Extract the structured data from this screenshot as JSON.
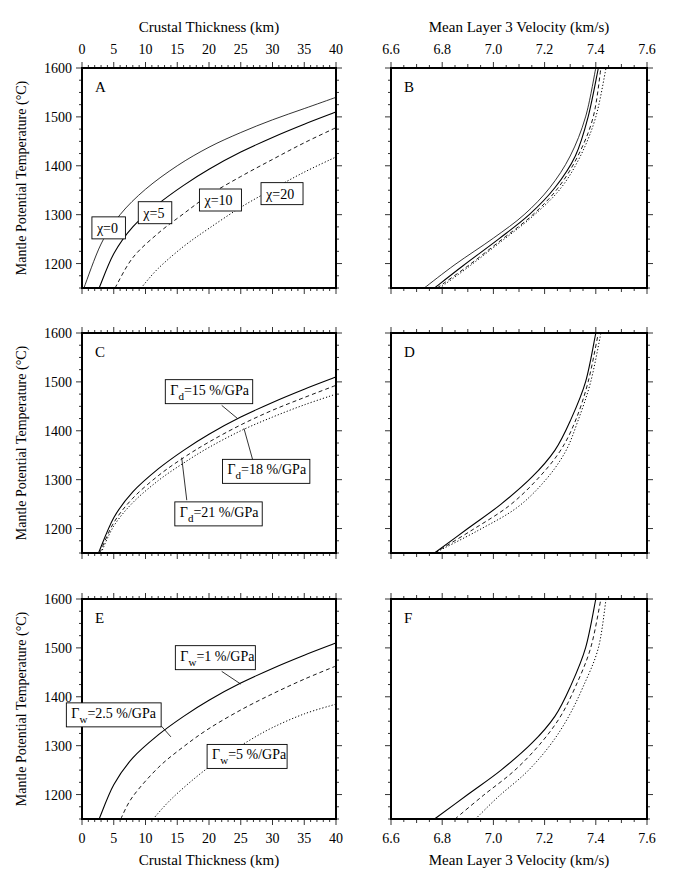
{
  "figure": {
    "top_left_xlabel": "Crustal Thickness (km)",
    "top_right_xlabel": "Mean Layer 3 Velocity (km/s)",
    "bottom_left_xlabel": "Crustal Thickness (km)",
    "bottom_right_xlabel": "Mean Layer 3 Velocity (km/s)",
    "ylabel": "Mantle Potential Temperature (°C)"
  },
  "chart_data": [
    {
      "panel": "A",
      "type": "line",
      "xlabel": "Crustal Thickness (km)",
      "ylabel": "Mantle Potential Temperature (°C)",
      "xlim": [
        0,
        40
      ],
      "ylim": [
        1150,
        1600
      ],
      "xticks": [
        0,
        5,
        10,
        15,
        20,
        25,
        30,
        35,
        40
      ],
      "yticks": [
        1200,
        1300,
        1400,
        1500,
        1600
      ],
      "grid": false,
      "series": [
        {
          "name": "χ=0",
          "style": "solid-thin",
          "x": [
            0.3,
            3,
            6,
            10,
            15,
            20,
            25,
            30,
            35,
            40
          ],
          "y": [
            1150,
            1240,
            1300,
            1352,
            1400,
            1438,
            1468,
            1494,
            1517,
            1540
          ]
        },
        {
          "name": "χ=5",
          "style": "solid",
          "x": [
            2.7,
            5,
            8,
            12,
            16,
            20,
            25,
            30,
            35,
            40
          ],
          "y": [
            1150,
            1220,
            1275,
            1322,
            1360,
            1393,
            1428,
            1458,
            1485,
            1510
          ]
        },
        {
          "name": "χ=10",
          "style": "dashed",
          "x": [
            5.2,
            8,
            12,
            16,
            20,
            25,
            30,
            35,
            40
          ],
          "y": [
            1150,
            1212,
            1262,
            1302,
            1340,
            1378,
            1413,
            1447,
            1478
          ]
        },
        {
          "name": "χ=20",
          "style": "dotted",
          "x": [
            9.3,
            12,
            16,
            20,
            25,
            30,
            35,
            40
          ],
          "y": [
            1150,
            1190,
            1235,
            1272,
            1315,
            1352,
            1387,
            1418
          ]
        }
      ],
      "annotations": [
        {
          "text": "χ=0",
          "x": 4.2,
          "y": 1273
        },
        {
          "text": "χ=5",
          "x": 11.5,
          "y": 1304
        },
        {
          "text": "χ=10",
          "x": 21.8,
          "y": 1330
        },
        {
          "text": "χ=20",
          "x": 31.5,
          "y": 1343
        }
      ]
    },
    {
      "panel": "B",
      "type": "line",
      "xlabel": "Mean Layer 3 Velocity (km/s)",
      "ylabel": "",
      "xlim": [
        6.6,
        7.6
      ],
      "ylim": [
        1150,
        1600
      ],
      "xticks": [
        6.6,
        6.8,
        7.0,
        7.2,
        7.4,
        7.6
      ],
      "yticks": [
        1200,
        1300,
        1400,
        1500,
        1600
      ],
      "grid": false,
      "series": [
        {
          "name": "χ=0",
          "style": "solid-thin",
          "x": [
            6.73,
            6.85,
            7.0,
            7.12,
            7.22,
            7.3,
            7.36,
            7.4
          ],
          "y": [
            1150,
            1198,
            1252,
            1300,
            1355,
            1420,
            1500,
            1600
          ]
        },
        {
          "name": "χ=5",
          "style": "solid",
          "x": [
            6.77,
            6.88,
            7.02,
            7.14,
            7.24,
            7.32,
            7.37,
            7.41
          ],
          "y": [
            1150,
            1195,
            1250,
            1300,
            1355,
            1420,
            1500,
            1600
          ]
        },
        {
          "name": "χ=10",
          "style": "dashed",
          "x": [
            6.78,
            6.9,
            7.03,
            7.15,
            7.25,
            7.33,
            7.39,
            7.42
          ],
          "y": [
            1150,
            1195,
            1248,
            1298,
            1353,
            1420,
            1500,
            1600
          ]
        },
        {
          "name": "χ=20",
          "style": "dotted",
          "x": [
            6.79,
            6.9,
            7.03,
            7.15,
            7.26,
            7.34,
            7.4,
            7.44
          ],
          "y": [
            1150,
            1192,
            1245,
            1295,
            1352,
            1420,
            1500,
            1600
          ]
        }
      ]
    },
    {
      "panel": "C",
      "type": "line",
      "xlabel": "Crustal Thickness (km)",
      "ylabel": "Mantle Potential Temperature (°C)",
      "xlim": [
        0,
        40
      ],
      "ylim": [
        1150,
        1600
      ],
      "xticks": [
        0,
        5,
        10,
        15,
        20,
        25,
        30,
        35,
        40
      ],
      "yticks": [
        1200,
        1300,
        1400,
        1500,
        1600
      ],
      "grid": false,
      "series": [
        {
          "name": "Γd=15 %/GPa",
          "style": "solid",
          "x": [
            2.6,
            5,
            8,
            12,
            16,
            20,
            25,
            30,
            35,
            40
          ],
          "y": [
            1150,
            1222,
            1275,
            1322,
            1360,
            1393,
            1428,
            1458,
            1485,
            1510
          ]
        },
        {
          "name": "Γd=18 %/GPa",
          "style": "dashed",
          "x": [
            2.8,
            5,
            8,
            12,
            16,
            20,
            25,
            30,
            35,
            40
          ],
          "y": [
            1150,
            1212,
            1262,
            1308,
            1345,
            1377,
            1412,
            1442,
            1468,
            1493
          ]
        },
        {
          "name": "Γd=21 %/GPa",
          "style": "dotted",
          "x": [
            3.0,
            5,
            8,
            12,
            16,
            20,
            25,
            30,
            35,
            40
          ],
          "y": [
            1150,
            1205,
            1253,
            1298,
            1334,
            1366,
            1400,
            1428,
            1453,
            1475
          ]
        }
      ],
      "annotations": [
        {
          "text": "Γd=15 %/GPa",
          "x": 20,
          "y": 1480
        },
        {
          "text": "Γd=18 %/GPa",
          "x": 29,
          "y": 1317
        },
        {
          "text": "Γd=21 %/GPa",
          "x": 21.5,
          "y": 1230
        }
      ]
    },
    {
      "panel": "D",
      "type": "line",
      "xlabel": "Mean Layer 3 Velocity (km/s)",
      "ylabel": "",
      "xlim": [
        6.6,
        7.6
      ],
      "ylim": [
        1150,
        1600
      ],
      "xticks": [
        6.6,
        6.8,
        7.0,
        7.2,
        7.4,
        7.6
      ],
      "yticks": [
        1200,
        1300,
        1400,
        1500,
        1600
      ],
      "grid": false,
      "series": [
        {
          "name": "Γd=15 %/GPa",
          "style": "solid",
          "x": [
            6.77,
            6.9,
            7.03,
            7.15,
            7.24,
            7.3,
            7.36,
            7.4
          ],
          "y": [
            1150,
            1200,
            1250,
            1305,
            1360,
            1420,
            1500,
            1600
          ]
        },
        {
          "name": "Γd=18 %/GPa",
          "style": "dashed",
          "x": [
            6.77,
            6.92,
            7.06,
            7.17,
            7.26,
            7.32,
            7.37,
            7.41
          ],
          "y": [
            1150,
            1198,
            1246,
            1300,
            1358,
            1420,
            1500,
            1600
          ]
        },
        {
          "name": "Γd=21 %/GPa",
          "style": "dotted",
          "x": [
            6.77,
            6.94,
            7.09,
            7.2,
            7.28,
            7.33,
            7.38,
            7.42
          ],
          "y": [
            1150,
            1196,
            1242,
            1297,
            1356,
            1420,
            1500,
            1600
          ]
        }
      ]
    },
    {
      "panel": "E",
      "type": "line",
      "xlabel": "Crustal Thickness (km)",
      "ylabel": "Mantle Potential Temperature (°C)",
      "xlim": [
        0,
        40
      ],
      "ylim": [
        1150,
        1600
      ],
      "xticks": [
        0,
        5,
        10,
        15,
        20,
        25,
        30,
        35,
        40
      ],
      "yticks": [
        1200,
        1300,
        1400,
        1500,
        1600
      ],
      "grid": false,
      "series": [
        {
          "name": "Γw=1 %/GPa",
          "style": "solid",
          "x": [
            2.7,
            5,
            8,
            12,
            16,
            20,
            25,
            30,
            35,
            40
          ],
          "y": [
            1150,
            1220,
            1275,
            1322,
            1360,
            1393,
            1428,
            1458,
            1485,
            1510
          ]
        },
        {
          "name": "Γw=2.5 %/GPa",
          "style": "dashed",
          "x": [
            6.1,
            8,
            12,
            16,
            20,
            25,
            30,
            35,
            40
          ],
          "y": [
            1150,
            1196,
            1255,
            1298,
            1335,
            1373,
            1406,
            1436,
            1463
          ]
        },
        {
          "name": "Γw=5 %/GPa",
          "style": "dotted",
          "x": [
            11.2,
            14,
            18,
            22,
            26,
            30,
            35,
            40
          ],
          "y": [
            1150,
            1190,
            1236,
            1275,
            1308,
            1337,
            1365,
            1385
          ]
        }
      ],
      "annotations": [
        {
          "text": "Γw=1 %/GPa",
          "x": 21,
          "y": 1480
        },
        {
          "text": "Γw=2.5 %/GPa",
          "x": 5,
          "y": 1363
        },
        {
          "text": "Γw=5 %/GPa",
          "x": 26,
          "y": 1278
        }
      ]
    },
    {
      "panel": "F",
      "type": "line",
      "xlabel": "Mean Layer 3 Velocity (km/s)",
      "ylabel": "",
      "xlim": [
        6.6,
        7.6
      ],
      "ylim": [
        1150,
        1600
      ],
      "xticks": [
        6.6,
        6.8,
        7.0,
        7.2,
        7.4,
        7.6
      ],
      "yticks": [
        1200,
        1300,
        1400,
        1500,
        1600
      ],
      "grid": false,
      "series": [
        {
          "name": "Γw=1 %/GPa",
          "style": "solid",
          "x": [
            6.77,
            6.9,
            7.03,
            7.15,
            7.24,
            7.3,
            7.36,
            7.4
          ],
          "y": [
            1150,
            1200,
            1250,
            1305,
            1360,
            1420,
            1500,
            1600
          ]
        },
        {
          "name": "Γw=2.5 %/GPa",
          "style": "dashed",
          "x": [
            6.85,
            6.96,
            7.08,
            7.18,
            7.26,
            7.32,
            7.38,
            7.42
          ],
          "y": [
            1150,
            1198,
            1248,
            1302,
            1358,
            1420,
            1500,
            1600
          ]
        },
        {
          "name": "Γw=5 %/GPa",
          "style": "dotted",
          "x": [
            6.93,
            7.02,
            7.13,
            7.22,
            7.29,
            7.35,
            7.41,
            7.44
          ],
          "y": [
            1150,
            1196,
            1246,
            1300,
            1356,
            1420,
            1500,
            1600
          ]
        }
      ]
    }
  ]
}
